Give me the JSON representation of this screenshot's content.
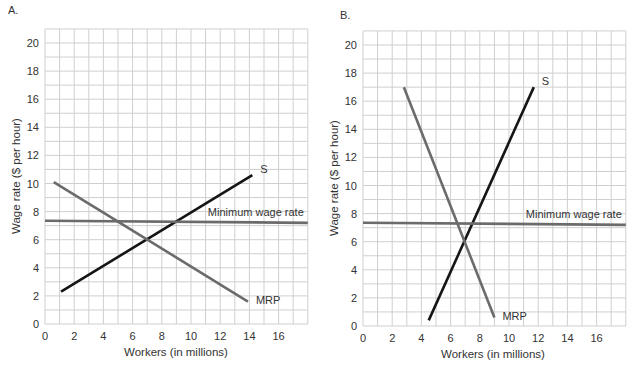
{
  "colors": {
    "background": "#ffffff",
    "grid": "#cfcfcf",
    "supply": "#151515",
    "mrp": "#6b6b6b",
    "minimum_wage": "#6b6b6b",
    "text": "#333333"
  },
  "chart_data": [
    {
      "panel": "A.",
      "type": "line",
      "xlabel": "Workers (in millions)",
      "ylabel": "Wage rate ($ per hour)",
      "xlim": [
        0,
        18
      ],
      "ylim": [
        0,
        21
      ],
      "x_ticks": [
        0,
        2,
        4,
        6,
        8,
        10,
        12,
        14,
        16
      ],
      "y_ticks": [
        0,
        2,
        4,
        6,
        8,
        10,
        12,
        14,
        16,
        18,
        20
      ],
      "grid": true,
      "grid_step": 1,
      "series": [
        {
          "name": "S",
          "label": "S",
          "points": [
            [
              1.1,
              2.3
            ],
            [
              14.2,
              10.6
            ]
          ]
        },
        {
          "name": "MRP",
          "label": "MRP",
          "points": [
            [
              0.6,
              10.1
            ],
            [
              13.9,
              1.6
            ]
          ]
        },
        {
          "name": "Minimum wage rate",
          "label": "Minimum wage rate",
          "points": [
            [
              0,
              7.35
            ],
            [
              18,
              7.2
            ]
          ]
        }
      ],
      "layout": {
        "x0_px": 45,
        "px_per_x": 14.6,
        "y0_px": 324,
        "px_per_y": 14.05
      }
    },
    {
      "panel": "B.",
      "type": "line",
      "xlabel": "Workers (in millions)",
      "ylabel": "Wage rate ($ per hour)",
      "xlim": [
        0,
        18
      ],
      "ylim": [
        0,
        21
      ],
      "x_ticks": [
        0,
        2,
        4,
        6,
        8,
        10,
        12,
        14,
        16
      ],
      "y_ticks": [
        0,
        2,
        4,
        6,
        8,
        10,
        12,
        14,
        16,
        18,
        20
      ],
      "grid": true,
      "grid_step": 1,
      "series": [
        {
          "name": "S",
          "label": "S",
          "points": [
            [
              4.5,
              0.4
            ],
            [
              11.7,
              17.0
            ]
          ]
        },
        {
          "name": "MRP",
          "label": "MRP",
          "points": [
            [
              2.8,
              17.0
            ],
            [
              9.0,
              0.6
            ]
          ]
        },
        {
          "name": "Minimum wage rate",
          "label": "Minimum wage rate",
          "points": [
            [
              0,
              7.35
            ],
            [
              18,
              7.2
            ]
          ]
        }
      ],
      "layout": {
        "x0_px": 363,
        "px_per_x": 14.6,
        "y0_px": 326,
        "px_per_y": 14.05
      }
    }
  ]
}
